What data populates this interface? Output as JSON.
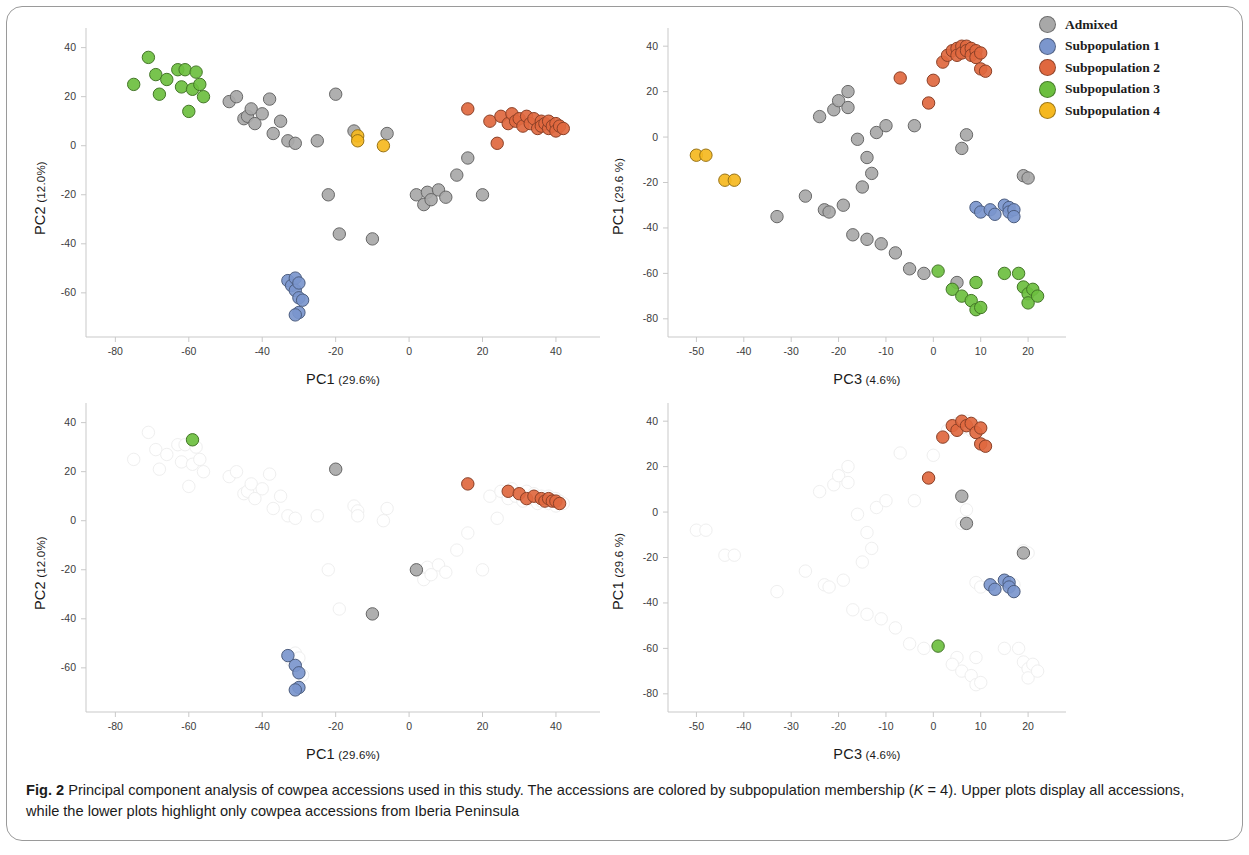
{
  "figure": {
    "label": "Fig. 2",
    "caption_part1": " Principal component analysis of cowpea accessions used in this study. The accessions are colored by subpopulation membership (",
    "caption_k_italic": "K",
    "caption_part2": " = 4). Upper plots display all accessions, while the lower plots highlight only cowpea accessions from Iberia Peninsula"
  },
  "legend": {
    "title": "",
    "items": [
      {
        "label": "Admixed",
        "color": "#a8a8a8"
      },
      {
        "label": "Subpopulation 1",
        "color": "#7b96cd"
      },
      {
        "label": "Subpopulation 2",
        "color": "#e0683f"
      },
      {
        "label": "Subpopulation 3",
        "color": "#6cbf3f"
      },
      {
        "label": "Subpopulation 4",
        "color": "#f5b820"
      }
    ]
  },
  "chart_data": [
    {
      "id": "top-left",
      "type": "scatter",
      "title": "",
      "xlabel": "PC1",
      "xlabel_pct": "(29.6%)",
      "ylabel": "PC2",
      "ylabel_pct": "(12.0%)",
      "xlim": [
        -88,
        52
      ],
      "ylim": [
        -78,
        48
      ],
      "xticks": [
        -80,
        -60,
        -40,
        -20,
        0,
        20,
        40
      ],
      "yticks": [
        40,
        20,
        0,
        -20,
        -40,
        -60
      ],
      "faded": false,
      "grid": false,
      "series": [
        {
          "name": "Subpopulation 3",
          "color": "#6cbf3f",
          "points": [
            [
              -75,
              25
            ],
            [
              -71,
              36
            ],
            [
              -69,
              29
            ],
            [
              -68,
              21
            ],
            [
              -66,
              27
            ],
            [
              -63,
              31
            ],
            [
              -62,
              24
            ],
            [
              -61,
              31
            ],
            [
              -60,
              14
            ],
            [
              -59,
              23
            ],
            [
              -58,
              30
            ],
            [
              -57,
              25
            ],
            [
              -56,
              20
            ]
          ]
        },
        {
          "name": "Admixed",
          "color": "#a8a8a8",
          "points": [
            [
              -49,
              18
            ],
            [
              -47,
              20
            ],
            [
              -45,
              11
            ],
            [
              -44,
              12
            ],
            [
              -43,
              15
            ],
            [
              -42,
              9
            ],
            [
              -40,
              13
            ],
            [
              -38,
              19
            ],
            [
              -37,
              5
            ],
            [
              -35,
              10
            ],
            [
              -33,
              2
            ],
            [
              -31,
              1
            ],
            [
              -25,
              2
            ],
            [
              -22,
              -20
            ],
            [
              -20,
              21
            ],
            [
              -19,
              -36
            ],
            [
              -15,
              6
            ],
            [
              -10,
              -38
            ],
            [
              -6,
              5
            ],
            [
              2,
              -20
            ],
            [
              4,
              -24
            ],
            [
              5,
              -19
            ],
            [
              6,
              -22
            ],
            [
              8,
              -18
            ],
            [
              10,
              -21
            ],
            [
              13,
              -12
            ],
            [
              16,
              -5
            ],
            [
              20,
              -20
            ]
          ]
        },
        {
          "name": "Subpopulation 4",
          "color": "#f5b820",
          "points": [
            [
              -14,
              4
            ],
            [
              -14,
              2
            ],
            [
              -7,
              0
            ]
          ]
        },
        {
          "name": "Subpopulation 2",
          "color": "#e0683f",
          "points": [
            [
              16,
              15
            ],
            [
              22,
              10
            ],
            [
              25,
              12
            ],
            [
              27,
              9
            ],
            [
              28,
              13
            ],
            [
              29,
              10
            ],
            [
              30,
              11
            ],
            [
              31,
              8
            ],
            [
              32,
              12
            ],
            [
              33,
              9
            ],
            [
              34,
              11
            ],
            [
              35,
              7
            ],
            [
              36,
              10
            ],
            [
              36,
              8
            ],
            [
              37,
              9
            ],
            [
              38,
              7
            ],
            [
              38,
              10
            ],
            [
              39,
              8
            ],
            [
              40,
              9
            ],
            [
              40,
              6
            ],
            [
              41,
              8
            ],
            [
              42,
              7
            ],
            [
              24,
              1
            ]
          ]
        },
        {
          "name": "Subpopulation 1",
          "color": "#7b96cd",
          "points": [
            [
              -33,
              -55
            ],
            [
              -32,
              -57
            ],
            [
              -31,
              -54
            ],
            [
              -31,
              -59
            ],
            [
              -30,
              -56
            ],
            [
              -30,
              -62
            ],
            [
              -29,
              -63
            ],
            [
              -30,
              -68
            ],
            [
              -31,
              -69
            ]
          ]
        }
      ]
    },
    {
      "id": "bottom-left",
      "type": "scatter",
      "title": "",
      "xlabel": "PC1",
      "xlabel_pct": "(29.6%)",
      "ylabel": "PC2",
      "ylabel_pct": "(12.0%)",
      "xlim": [
        -88,
        52
      ],
      "ylim": [
        -78,
        48
      ],
      "xticks": [
        -80,
        -60,
        -40,
        -20,
        0,
        20,
        40
      ],
      "yticks": [
        40,
        20,
        0,
        -20,
        -40,
        -60
      ],
      "faded": true,
      "grid": false,
      "highlight_note": "only Iberia Peninsula accessions highlighted",
      "series": [
        {
          "name": "Subpopulation 3",
          "color": "#6cbf3f",
          "points": [
            [
              -59,
              33
            ]
          ],
          "highlight": [
            0
          ]
        },
        {
          "name": "Admixed",
          "color": "#a8a8a8",
          "points": [
            [
              -20,
              21
            ],
            [
              2,
              -20
            ],
            [
              -10,
              -38
            ]
          ],
          "highlight": [
            0,
            1,
            2
          ]
        },
        {
          "name": "Subpopulation 2",
          "color": "#e0683f",
          "points": [
            [
              16,
              15
            ],
            [
              27,
              12
            ],
            [
              30,
              11
            ],
            [
              32,
              9
            ],
            [
              34,
              10
            ],
            [
              36,
              9
            ],
            [
              37,
              8
            ],
            [
              38,
              9
            ],
            [
              39,
              8
            ],
            [
              40,
              8
            ],
            [
              41,
              7
            ]
          ],
          "highlight": [
            0,
            1,
            2,
            3,
            4,
            5,
            6,
            7,
            8,
            9,
            10
          ]
        },
        {
          "name": "Subpopulation 1",
          "color": "#7b96cd",
          "points": [
            [
              -33,
              -55
            ],
            [
              -31,
              -59
            ],
            [
              -30,
              -62
            ],
            [
              -30,
              -68
            ],
            [
              -31,
              -69
            ]
          ],
          "highlight": [
            0,
            1,
            2,
            3,
            4
          ]
        }
      ]
    },
    {
      "id": "top-right",
      "type": "scatter",
      "title": "",
      "xlabel": "PC3",
      "xlabel_pct": "(4.6%)",
      "ylabel": "PC1",
      "ylabel_pct": "(29.6 %)",
      "xlim": [
        -56,
        28
      ],
      "ylim": [
        -88,
        48
      ],
      "xticks": [
        -50,
        -40,
        -30,
        -20,
        -10,
        0,
        10,
        20
      ],
      "yticks": [
        40,
        20,
        0,
        -20,
        -40,
        -60,
        -80
      ],
      "faded": false,
      "grid": false,
      "series": [
        {
          "name": "Subpopulation 4",
          "color": "#f5b820",
          "points": [
            [
              -50,
              -8
            ],
            [
              -48,
              -8
            ],
            [
              -44,
              -19
            ],
            [
              -42,
              -19
            ]
          ]
        },
        {
          "name": "Admixed",
          "color": "#a8a8a8",
          "points": [
            [
              -33,
              -35
            ],
            [
              -27,
              -26
            ],
            [
              -24,
              9
            ],
            [
              -23,
              -32
            ],
            [
              -22,
              -33
            ],
            [
              -21,
              12
            ],
            [
              -20,
              16
            ],
            [
              -19,
              -30
            ],
            [
              -18,
              13
            ],
            [
              -18,
              20
            ],
            [
              -17,
              -43
            ],
            [
              -16,
              -1
            ],
            [
              -15,
              -22
            ],
            [
              -14,
              -9
            ],
            [
              -14,
              -45
            ],
            [
              -13,
              -16
            ],
            [
              -12,
              2
            ],
            [
              -11,
              -47
            ],
            [
              -10,
              5
            ],
            [
              -8,
              -51
            ],
            [
              -5,
              -58
            ],
            [
              -4,
              5
            ],
            [
              -2,
              -60
            ],
            [
              5,
              -64
            ],
            [
              6,
              -5
            ],
            [
              7,
              1
            ],
            [
              19,
              -17
            ],
            [
              20,
              -18
            ]
          ]
        },
        {
          "name": "Subpopulation 2",
          "color": "#e0683f",
          "points": [
            [
              -7,
              26
            ],
            [
              -1,
              15
            ],
            [
              0,
              25
            ],
            [
              2,
              33
            ],
            [
              3,
              36
            ],
            [
              4,
              38
            ],
            [
              5,
              39
            ],
            [
              5,
              36
            ],
            [
              6,
              40
            ],
            [
              6,
              37
            ],
            [
              7,
              40
            ],
            [
              7,
              38
            ],
            [
              8,
              39
            ],
            [
              8,
              36
            ],
            [
              9,
              38
            ],
            [
              9,
              35
            ],
            [
              10,
              37
            ],
            [
              10,
              30
            ],
            [
              11,
              29
            ]
          ]
        },
        {
          "name": "Subpopulation 1",
          "color": "#7b96cd",
          "points": [
            [
              9,
              -31
            ],
            [
              10,
              -33
            ],
            [
              12,
              -32
            ],
            [
              13,
              -34
            ],
            [
              15,
              -30
            ],
            [
              16,
              -31
            ],
            [
              16,
              -33
            ],
            [
              17,
              -32
            ],
            [
              17,
              -35
            ]
          ]
        },
        {
          "name": "Subpopulation 3",
          "color": "#6cbf3f",
          "points": [
            [
              1,
              -59
            ],
            [
              4,
              -67
            ],
            [
              6,
              -70
            ],
            [
              8,
              -72
            ],
            [
              9,
              -64
            ],
            [
              9,
              -76
            ],
            [
              10,
              -75
            ],
            [
              15,
              -60
            ],
            [
              18,
              -60
            ],
            [
              19,
              -66
            ],
            [
              20,
              -69
            ],
            [
              20,
              -73
            ],
            [
              21,
              -67
            ],
            [
              22,
              -70
            ]
          ]
        }
      ]
    },
    {
      "id": "bottom-right",
      "type": "scatter",
      "title": "",
      "xlabel": "PC3",
      "xlabel_pct": "(4.6%)",
      "ylabel": "PC1",
      "ylabel_pct": "(29.6 %)",
      "xlim": [
        -56,
        28
      ],
      "ylim": [
        -88,
        48
      ],
      "xticks": [
        -50,
        -40,
        -30,
        -20,
        -10,
        0,
        10,
        20
      ],
      "yticks": [
        40,
        20,
        0,
        -20,
        -40,
        -60,
        -80
      ],
      "faded": true,
      "grid": false,
      "highlight_note": "only Iberia Peninsula accessions highlighted",
      "series": [
        {
          "name": "Subpopulation 2",
          "color": "#e0683f",
          "points": [
            [
              -1,
              15
            ],
            [
              2,
              33
            ],
            [
              4,
              38
            ],
            [
              5,
              36
            ],
            [
              6,
              40
            ],
            [
              7,
              38
            ],
            [
              8,
              39
            ],
            [
              9,
              35
            ],
            [
              10,
              37
            ],
            [
              10,
              30
            ],
            [
              11,
              29
            ]
          ],
          "highlight": [
            0,
            1,
            2,
            3,
            4,
            5,
            6,
            7,
            8,
            9,
            10
          ]
        },
        {
          "name": "Admixed",
          "color": "#a8a8a8",
          "points": [
            [
              6,
              7
            ],
            [
              7,
              -5
            ],
            [
              19,
              -18
            ]
          ],
          "highlight": [
            0,
            1,
            2
          ]
        },
        {
          "name": "Subpopulation 1",
          "color": "#7b96cd",
          "points": [
            [
              12,
              -32
            ],
            [
              13,
              -34
            ],
            [
              15,
              -30
            ],
            [
              16,
              -31
            ],
            [
              16,
              -33
            ],
            [
              17,
              -35
            ]
          ],
          "highlight": [
            0,
            1,
            2,
            3,
            4,
            5
          ]
        },
        {
          "name": "Subpopulation 3",
          "color": "#6cbf3f",
          "points": [
            [
              1,
              -59
            ]
          ],
          "highlight": [
            0
          ]
        }
      ]
    }
  ]
}
